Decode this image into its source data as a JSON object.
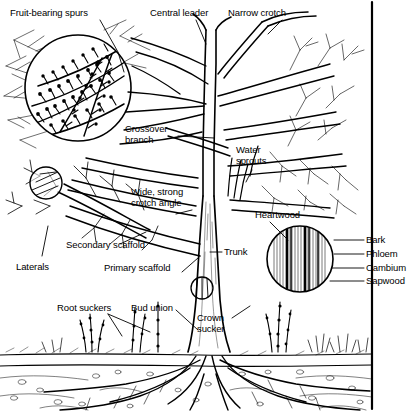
{
  "figure": {
    "style": "black and white line art",
    "border_color": "#000000",
    "background": "#ffffff"
  },
  "labels": {
    "fruit_bearing_spurs": "Fruit-bearing spurs",
    "central_leader": "Central leader",
    "narrow_crotch": "Narrow crotch",
    "crossover_branch": "Crossover\nbranch",
    "water_sprouts": "Water\nsprouts",
    "wide_strong_crotch_angle": "Wide, strong\ncrotch angle",
    "heartwood": "Heartwood",
    "secondary_scaffold": "Secondary scaffold",
    "laterals": "Laterals",
    "primary_scaffold": "Primary scaffold",
    "trunk": "Trunk",
    "bark": "Bark",
    "phloem": "Phloem",
    "cambium": "Cambium",
    "sapwood": "Sapwood",
    "root_suckers": "Root suckers",
    "bud_union": "Bud union",
    "crown_sucker": "Crown\nsucker"
  }
}
